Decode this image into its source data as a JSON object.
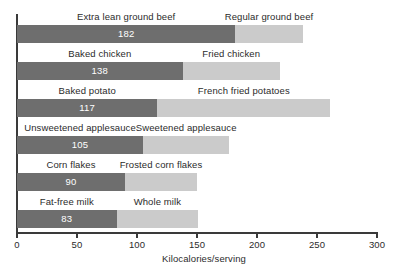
{
  "chart_data": {
    "type": "bar",
    "orientation": "horizontal",
    "stacked": false,
    "grouped_pairs": true,
    "title": "",
    "xlabel": "Kilocalories/serving",
    "ylabel": "",
    "xlim": [
      0,
      300
    ],
    "xticks": [
      0,
      50,
      100,
      150,
      200,
      250,
      300
    ],
    "xtick_labels": [
      "0",
      "50",
      "100",
      "150",
      "200",
      "250",
      "300"
    ],
    "grid": false,
    "legend": "none",
    "colors": {
      "lower_calorie_bar": "#6e6e6e",
      "higher_calorie_bar": "#cbcbcb",
      "value_label_text": "#ffffff",
      "axis": "#3a3a3a",
      "background": "#ffffff"
    },
    "categories": [
      "Extra lean ground beef / Regular ground beef",
      "Baked chicken / Fried chicken",
      "Baked potato / French fried potatoes",
      "Unsweetened applesauce / Sweetened applesauce",
      "Corn flakes / Frosted corn flakes",
      "Fat-free milk / Whole milk"
    ],
    "series": [
      {
        "name": "Lower-calorie food",
        "values": [
          182,
          138,
          117,
          105,
          90,
          83
        ]
      },
      {
        "name": "Higher-calorie food",
        "values": [
          238,
          219,
          261,
          177,
          150,
          151
        ]
      }
    ],
    "rows": [
      {
        "dark_label": "Extra lean ground beef",
        "dark_value": 182,
        "dark_value_text": "182",
        "light_label": "Regular ground beef",
        "light_value": 238
      },
      {
        "dark_label": "Baked chicken",
        "dark_value": 138,
        "dark_value_text": "138",
        "light_label": "Fried chicken",
        "light_value": 219
      },
      {
        "dark_label": "Baked potato",
        "dark_value": 117,
        "dark_value_text": "117",
        "light_label": "French fried potatoes",
        "light_value": 261
      },
      {
        "dark_label": "Unsweetened applesauce",
        "dark_value": 105,
        "dark_value_text": "105",
        "light_label": "Sweetened applesauce",
        "light_value": 177
      },
      {
        "dark_label": "Corn flakes",
        "dark_value": 90,
        "dark_value_text": "90",
        "light_label": "Frosted corn flakes",
        "light_value": 150
      },
      {
        "dark_label": "Fat-free milk",
        "dark_value": 83,
        "dark_value_text": "83",
        "light_label": "Whole milk",
        "light_value": 151
      }
    ]
  }
}
